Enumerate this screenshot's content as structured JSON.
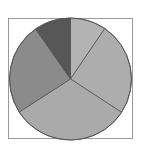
{
  "chart_data": {
    "type": "pie",
    "title": "",
    "legend": [],
    "start_angle_deg": 0,
    "direction": "clockwise",
    "slices": [
      {
        "label": "",
        "value": 9.5,
        "color": "#b3b3b3"
      },
      {
        "label": "",
        "value": 24.7,
        "color": "#adadad"
      },
      {
        "label": "",
        "value": 31.7,
        "color": "#aaaaaa"
      },
      {
        "label": "",
        "value": 24.4,
        "color": "#8b8b8b"
      },
      {
        "label": "",
        "value": 9.7,
        "color": "#575757"
      }
    ],
    "frame": {
      "visible": true,
      "color": "#9a9a9a"
    },
    "outline_color": "#555555"
  }
}
